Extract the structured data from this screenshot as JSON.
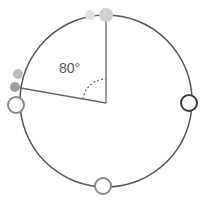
{
  "diagram": {
    "title": "",
    "angle_label": "80°",
    "center": {
      "x": 106,
      "y": 103
    },
    "radius": 85,
    "colors": {
      "circle_stroke": "#555555",
      "line_stroke": "#666666",
      "dot_light": "#d8d8d8",
      "dot_mid": "#bbbbbb",
      "dot_dark": "#999999",
      "open_marker_stroke_dark": "#3a3a3a",
      "open_marker_stroke_light": "#888888"
    },
    "markers": [
      {
        "name": "top-large-dot",
        "type": "filled",
        "x": 106,
        "y": 15
      },
      {
        "name": "top-small-dot",
        "type": "filled",
        "x": 90,
        "y": 15
      },
      {
        "name": "upper-left-dot",
        "type": "filled",
        "x": 18,
        "y": 74
      },
      {
        "name": "left-dot",
        "type": "filled",
        "x": 15,
        "y": 87
      },
      {
        "name": "left-open-marker",
        "type": "open",
        "x": 16,
        "y": 105
      },
      {
        "name": "right-open-marker",
        "type": "open",
        "x": 189,
        "y": 103
      },
      {
        "name": "bottom-open-marker",
        "type": "open",
        "x": 103,
        "y": 186
      }
    ]
  }
}
